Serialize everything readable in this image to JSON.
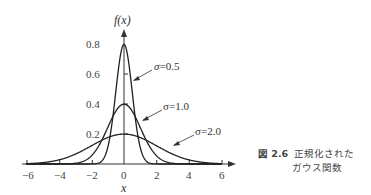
{
  "chart_data": {
    "type": "line",
    "title": "",
    "xlabel": "x",
    "ylabel": "f(x)",
    "xlim": [
      -6,
      6
    ],
    "ylim": [
      0,
      0.85
    ],
    "x_ticks": [
      -6,
      -4,
      -2,
      0,
      2,
      4,
      6
    ],
    "x_tick_labels": [
      "−6",
      "−4",
      "−2",
      "0",
      "2",
      "4",
      "6"
    ],
    "y_ticks": [
      0.2,
      0.4,
      0.6,
      0.8
    ],
    "y_tick_labels": [
      "0.2",
      "0.4",
      "0.6",
      "0.8"
    ],
    "grid": false,
    "series": [
      {
        "name": "σ=0.5",
        "function": "normal pdf, mean 0, sigma 0.5",
        "peak": 0.798
      },
      {
        "name": "σ=1.0",
        "function": "normal pdf, mean 0, sigma 1.0",
        "peak": 0.399
      },
      {
        "name": "σ=2.0",
        "function": "normal pdf, mean 0, sigma 2.0",
        "peak": 0.199
      }
    ],
    "annotations": [
      "σ=0.5",
      "σ=1.0",
      "σ=2.0"
    ]
  },
  "caption": {
    "figure_number": "図 2.6",
    "line1": "正規化された",
    "line2": "ガウス関数"
  },
  "labels": {
    "y_axis": "f(x)",
    "x_axis": "x",
    "sigma05": "σ=0.5",
    "sigma10": "σ=1.0",
    "sigma20": "σ=2.0",
    "t_m6": "−6",
    "t_m4": "−4",
    "t_m2": "−2",
    "t_0": "0",
    "t_2": "2",
    "t_4": "4",
    "t_6": "6",
    "y02": "0.2",
    "y04": "0.4",
    "y06": "0.6",
    "y08": "0.8"
  }
}
